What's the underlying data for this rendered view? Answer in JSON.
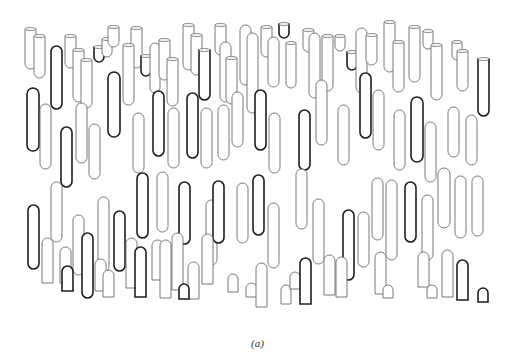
{
  "figure": {
    "caption": "(a)",
    "colors": {
      "background": "#ffffff",
      "thin_outline": "#6a6a6a",
      "thick_outline": "#1e1e1e"
    }
  },
  "shapes": [
    {
      "x": 25,
      "y": 29,
      "w": 11,
      "h": 40,
      "type": "tube",
      "s": "thin"
    },
    {
      "x": 34,
      "y": 36,
      "w": 11,
      "h": 42,
      "type": "tube",
      "s": "thin"
    },
    {
      "x": 51,
      "y": 46,
      "w": 11,
      "h": 63,
      "type": "rod",
      "s": "thick"
    },
    {
      "x": 65,
      "y": 36,
      "w": 11,
      "h": 32,
      "type": "tube",
      "s": "thin"
    },
    {
      "x": 73,
      "y": 50,
      "w": 11,
      "h": 52,
      "type": "tube",
      "s": "thin"
    },
    {
      "x": 81,
      "y": 60,
      "w": 11,
      "h": 48,
      "type": "tube",
      "s": "thin"
    },
    {
      "x": 94,
      "y": 47,
      "w": 10,
      "h": 15,
      "type": "cup",
      "s": "thick"
    },
    {
      "x": 102,
      "y": 39,
      "w": 10,
      "h": 18,
      "type": "tube",
      "s": "thin"
    },
    {
      "x": 108,
      "y": 27,
      "w": 11,
      "h": 20,
      "type": "tube",
      "s": "thin"
    },
    {
      "x": 131,
      "y": 28,
      "w": 11,
      "h": 40,
      "type": "tube",
      "s": "thin"
    },
    {
      "x": 123,
      "y": 45,
      "w": 11,
      "h": 60,
      "type": "tube",
      "s": "thin"
    },
    {
      "x": 141,
      "y": 56,
      "w": 10,
      "h": 20,
      "type": "cup",
      "s": "thick"
    },
    {
      "x": 150,
      "y": 43,
      "w": 10,
      "h": 50,
      "type": "rod",
      "s": "thin"
    },
    {
      "x": 159,
      "y": 40,
      "w": 11,
      "h": 40,
      "type": "tube",
      "s": "thin"
    },
    {
      "x": 167,
      "y": 59,
      "w": 11,
      "h": 47,
      "type": "tube",
      "s": "thin"
    },
    {
      "x": 183,
      "y": 25,
      "w": 11,
      "h": 45,
      "type": "tube",
      "s": "thin"
    },
    {
      "x": 191,
      "y": 35,
      "w": 11,
      "h": 40,
      "type": "tube",
      "s": "thin"
    },
    {
      "x": 199,
      "y": 50,
      "w": 11,
      "h": 50,
      "type": "tube",
      "s": "thick"
    },
    {
      "x": 215,
      "y": 25,
      "w": 11,
      "h": 30,
      "type": "tube",
      "s": "thin"
    },
    {
      "x": 220,
      "y": 42,
      "w": 11,
      "h": 60,
      "type": "rod",
      "s": "thin"
    },
    {
      "x": 226,
      "y": 58,
      "w": 11,
      "h": 46,
      "type": "tube",
      "s": "thin"
    },
    {
      "x": 240,
      "y": 25,
      "w": 11,
      "h": 60,
      "type": "rod",
      "s": "thin"
    },
    {
      "x": 247,
      "y": 33,
      "w": 11,
      "h": 80,
      "type": "rod",
      "s": "thin"
    },
    {
      "x": 261,
      "y": 27,
      "w": 11,
      "h": 30,
      "type": "tube",
      "s": "thin"
    },
    {
      "x": 268,
      "y": 37,
      "w": 11,
      "h": 50,
      "type": "rod",
      "s": "thin"
    },
    {
      "x": 279,
      "y": 24,
      "w": 10,
      "h": 14,
      "type": "cup",
      "s": "thick"
    },
    {
      "x": 286,
      "y": 43,
      "w": 10,
      "h": 45,
      "type": "tube",
      "s": "thin"
    },
    {
      "x": 303,
      "y": 30,
      "w": 11,
      "h": 22,
      "type": "tube",
      "s": "thin"
    },
    {
      "x": 309,
      "y": 33,
      "w": 11,
      "h": 65,
      "type": "rod",
      "s": "thin"
    },
    {
      "x": 322,
      "y": 36,
      "w": 11,
      "h": 55,
      "type": "tube",
      "s": "thin"
    },
    {
      "x": 335,
      "y": 36,
      "w": 10,
      "h": 15,
      "type": "cup",
      "s": "thin"
    },
    {
      "x": 347,
      "y": 52,
      "w": 10,
      "h": 18,
      "type": "cup",
      "s": "thick"
    },
    {
      "x": 356,
      "y": 28,
      "w": 11,
      "h": 65,
      "type": "rod",
      "s": "thin"
    },
    {
      "x": 366,
      "y": 35,
      "w": 11,
      "h": 30,
      "type": "tube",
      "s": "thin"
    },
    {
      "x": 384,
      "y": 22,
      "w": 11,
      "h": 50,
      "type": "tube",
      "s": "thin"
    },
    {
      "x": 393,
      "y": 42,
      "w": 11,
      "h": 50,
      "type": "tube",
      "s": "thin"
    },
    {
      "x": 409,
      "y": 27,
      "w": 11,
      "h": 55,
      "type": "tube",
      "s": "thin"
    },
    {
      "x": 423,
      "y": 31,
      "w": 10,
      "h": 18,
      "type": "tube",
      "s": "thin"
    },
    {
      "x": 431,
      "y": 45,
      "w": 11,
      "h": 55,
      "type": "tube",
      "s": "thin"
    },
    {
      "x": 452,
      "y": 42,
      "w": 10,
      "h": 18,
      "type": "tube",
      "s": "thin"
    },
    {
      "x": 457,
      "y": 51,
      "w": 11,
      "h": 40,
      "type": "tube",
      "s": "thin"
    },
    {
      "x": 478,
      "y": 59,
      "w": 11,
      "h": 57,
      "type": "tube",
      "s": "thick"
    },
    {
      "x": 27,
      "y": 88,
      "w": 12,
      "h": 63,
      "type": "rod",
      "s": "thick"
    },
    {
      "x": 40,
      "y": 104,
      "w": 11,
      "h": 65,
      "type": "rod",
      "s": "thin"
    },
    {
      "x": 61,
      "y": 127,
      "w": 11,
      "h": 60,
      "type": "rod",
      "s": "thick"
    },
    {
      "x": 76,
      "y": 103,
      "w": 11,
      "h": 60,
      "type": "rod",
      "s": "thin"
    },
    {
      "x": 89,
      "y": 124,
      "w": 11,
      "h": 55,
      "type": "rod",
      "s": "thin"
    },
    {
      "x": 108,
      "y": 72,
      "w": 12,
      "h": 65,
      "type": "rod",
      "s": "thick"
    },
    {
      "x": 133,
      "y": 113,
      "w": 11,
      "h": 60,
      "type": "rod",
      "s": "thin"
    },
    {
      "x": 153,
      "y": 91,
      "w": 11,
      "h": 65,
      "type": "rod",
      "s": "thick"
    },
    {
      "x": 168,
      "y": 108,
      "w": 11,
      "h": 60,
      "type": "rod",
      "s": "thin"
    },
    {
      "x": 187,
      "y": 93,
      "w": 11,
      "h": 65,
      "type": "rod",
      "s": "thick"
    },
    {
      "x": 201,
      "y": 108,
      "w": 11,
      "h": 60,
      "type": "rod",
      "s": "thin"
    },
    {
      "x": 218,
      "y": 105,
      "w": 11,
      "h": 55,
      "type": "rod",
      "s": "thin"
    },
    {
      "x": 232,
      "y": 92,
      "w": 11,
      "h": 55,
      "type": "rod",
      "s": "thin"
    },
    {
      "x": 255,
      "y": 90,
      "w": 11,
      "h": 60,
      "type": "rod",
      "s": "thick"
    },
    {
      "x": 269,
      "y": 113,
      "w": 11,
      "h": 60,
      "type": "rod",
      "s": "thin"
    },
    {
      "x": 299,
      "y": 110,
      "w": 11,
      "h": 60,
      "type": "rod",
      "s": "thick"
    },
    {
      "x": 316,
      "y": 80,
      "w": 11,
      "h": 65,
      "type": "rod",
      "s": "thin"
    },
    {
      "x": 338,
      "y": 105,
      "w": 11,
      "h": 60,
      "type": "rod",
      "s": "thin"
    },
    {
      "x": 360,
      "y": 73,
      "w": 11,
      "h": 65,
      "type": "rod",
      "s": "thick"
    },
    {
      "x": 373,
      "y": 90,
      "w": 11,
      "h": 60,
      "type": "rod",
      "s": "thin"
    },
    {
      "x": 394,
      "y": 110,
      "w": 11,
      "h": 60,
      "type": "rod",
      "s": "thin"
    },
    {
      "x": 411,
      "y": 97,
      "w": 12,
      "h": 65,
      "type": "rod",
      "s": "thick"
    },
    {
      "x": 425,
      "y": 122,
      "w": 11,
      "h": 60,
      "type": "rod",
      "s": "thin"
    },
    {
      "x": 448,
      "y": 107,
      "w": 11,
      "h": 50,
      "type": "rod",
      "s": "thin"
    },
    {
      "x": 466,
      "y": 115,
      "w": 11,
      "h": 50,
      "type": "rod",
      "s": "thin"
    },
    {
      "x": 28,
      "y": 205,
      "w": 11,
      "h": 64,
      "type": "rod",
      "s": "thick"
    },
    {
      "x": 51,
      "y": 182,
      "w": 11,
      "h": 60,
      "type": "rod",
      "s": "thin"
    },
    {
      "x": 73,
      "y": 215,
      "w": 11,
      "h": 60,
      "type": "rod",
      "s": "thin"
    },
    {
      "x": 82,
      "y": 233,
      "w": 11,
      "h": 65,
      "type": "rod",
      "s": "thick"
    },
    {
      "x": 98,
      "y": 197,
      "w": 11,
      "h": 75,
      "type": "rod",
      "s": "thin"
    },
    {
      "x": 114,
      "y": 211,
      "w": 11,
      "h": 60,
      "type": "rod",
      "s": "thick"
    },
    {
      "x": 137,
      "y": 173,
      "w": 11,
      "h": 65,
      "type": "rod",
      "s": "thick"
    },
    {
      "x": 157,
      "y": 172,
      "w": 11,
      "h": 60,
      "type": "rod",
      "s": "thin"
    },
    {
      "x": 179,
      "y": 182,
      "w": 11,
      "h": 62,
      "type": "rod",
      "s": "thick"
    },
    {
      "x": 206,
      "y": 200,
      "w": 11,
      "h": 65,
      "type": "rod",
      "s": "thin"
    },
    {
      "x": 213,
      "y": 181,
      "w": 11,
      "h": 62,
      "type": "rod",
      "s": "thick"
    },
    {
      "x": 237,
      "y": 183,
      "w": 11,
      "h": 60,
      "type": "rod",
      "s": "thin"
    },
    {
      "x": 253,
      "y": 175,
      "w": 11,
      "h": 60,
      "type": "rod",
      "s": "thick"
    },
    {
      "x": 268,
      "y": 203,
      "w": 11,
      "h": 65,
      "type": "rod",
      "s": "thin"
    },
    {
      "x": 296,
      "y": 169,
      "w": 11,
      "h": 60,
      "type": "rod",
      "s": "thin"
    },
    {
      "x": 313,
      "y": 199,
      "w": 11,
      "h": 65,
      "type": "rod",
      "s": "thin"
    },
    {
      "x": 343,
      "y": 210,
      "w": 11,
      "h": 70,
      "type": "rod",
      "s": "thick"
    },
    {
      "x": 358,
      "y": 212,
      "w": 11,
      "h": 55,
      "type": "rod",
      "s": "thin"
    },
    {
      "x": 372,
      "y": 178,
      "w": 11,
      "h": 62,
      "type": "rod",
      "s": "thin"
    },
    {
      "x": 386,
      "y": 180,
      "w": 11,
      "h": 80,
      "type": "rod",
      "s": "thin"
    },
    {
      "x": 405,
      "y": 182,
      "w": 11,
      "h": 60,
      "type": "rod",
      "s": "thick"
    },
    {
      "x": 422,
      "y": 195,
      "w": 11,
      "h": 65,
      "type": "rod",
      "s": "thin"
    },
    {
      "x": 438,
      "y": 168,
      "w": 12,
      "h": 60,
      "type": "rod",
      "s": "thin"
    },
    {
      "x": 455,
      "y": 176,
      "w": 11,
      "h": 62,
      "type": "rod",
      "s": "thin"
    },
    {
      "x": 472,
      "y": 176,
      "w": 11,
      "h": 60,
      "type": "rod",
      "s": "thin"
    },
    {
      "x": 42,
      "y": 238,
      "w": 11,
      "h": 45,
      "type": "stub",
      "s": "thin"
    },
    {
      "x": 60,
      "y": 247,
      "w": 11,
      "h": 36,
      "type": "stub",
      "s": "thin"
    },
    {
      "x": 62,
      "y": 266,
      "w": 11,
      "h": 25,
      "type": "stub",
      "s": "thick"
    },
    {
      "x": 95,
      "y": 259,
      "w": 11,
      "h": 32,
      "type": "stub",
      "s": "thin"
    },
    {
      "x": 103,
      "y": 270,
      "w": 11,
      "h": 27,
      "type": "stub",
      "s": "thin"
    },
    {
      "x": 126,
      "y": 238,
      "w": 11,
      "h": 50,
      "type": "stub",
      "s": "thin"
    },
    {
      "x": 135,
      "y": 247,
      "w": 11,
      "h": 50,
      "type": "stub",
      "s": "thick"
    },
    {
      "x": 152,
      "y": 240,
      "w": 11,
      "h": 40,
      "type": "stub",
      "s": "thin"
    },
    {
      "x": 160,
      "y": 240,
      "w": 11,
      "h": 58,
      "type": "stub",
      "s": "thin"
    },
    {
      "x": 172,
      "y": 233,
      "w": 11,
      "h": 57,
      "type": "stub",
      "s": "thin"
    },
    {
      "x": 188,
      "y": 262,
      "w": 11,
      "h": 37,
      "type": "stub",
      "s": "thin"
    },
    {
      "x": 179,
      "y": 284,
      "w": 10,
      "h": 15,
      "type": "stub",
      "s": "thick"
    },
    {
      "x": 202,
      "y": 234,
      "w": 11,
      "h": 50,
      "type": "stub",
      "s": "thin"
    },
    {
      "x": 228,
      "y": 274,
      "w": 10,
      "h": 18,
      "type": "stub",
      "s": "thin"
    },
    {
      "x": 246,
      "y": 283,
      "w": 11,
      "h": 14,
      "type": "stub",
      "s": "thin"
    },
    {
      "x": 256,
      "y": 263,
      "w": 11,
      "h": 44,
      "type": "stub",
      "s": "thin"
    },
    {
      "x": 281,
      "y": 285,
      "w": 10,
      "h": 19,
      "type": "stub",
      "s": "thin"
    },
    {
      "x": 290,
      "y": 272,
      "w": 10,
      "h": 17,
      "type": "stub",
      "s": "thin"
    },
    {
      "x": 300,
      "y": 258,
      "w": 11,
      "h": 46,
      "type": "stub",
      "s": "thick"
    },
    {
      "x": 324,
      "y": 255,
      "w": 11,
      "h": 40,
      "type": "stub",
      "s": "thin"
    },
    {
      "x": 336,
      "y": 257,
      "w": 11,
      "h": 40,
      "type": "stub",
      "s": "thin"
    },
    {
      "x": 375,
      "y": 252,
      "w": 11,
      "h": 42,
      "type": "stub",
      "s": "thin"
    },
    {
      "x": 383,
      "y": 285,
      "w": 10,
      "h": 13,
      "type": "stub",
      "s": "thin"
    },
    {
      "x": 418,
      "y": 252,
      "w": 11,
      "h": 35,
      "type": "stub",
      "s": "thin"
    },
    {
      "x": 442,
      "y": 250,
      "w": 11,
      "h": 47,
      "type": "stub",
      "s": "thin"
    },
    {
      "x": 427,
      "y": 285,
      "w": 10,
      "h": 13,
      "type": "stub",
      "s": "thin"
    },
    {
      "x": 457,
      "y": 260,
      "w": 11,
      "h": 40,
      "type": "stub",
      "s": "thick"
    },
    {
      "x": 478,
      "y": 288,
      "w": 10,
      "h": 14,
      "type": "stub",
      "s": "thick"
    }
  ]
}
